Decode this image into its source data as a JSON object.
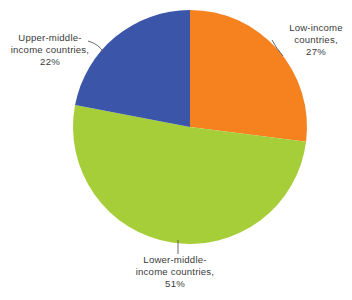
{
  "chart_data": {
    "type": "pie",
    "title": "",
    "categories": [
      "Low-income countries",
      "Lower-middle-income countries",
      "Upper-middle-income countries"
    ],
    "values": [
      27,
      51,
      22
    ],
    "value_unit": "%",
    "colors": [
      "#F5821F",
      "#A6CE39",
      "#3B55A8"
    ],
    "background": "#FFFFFF",
    "text_color": "#3A3A3A",
    "legend": "none",
    "labels_position": "outside-with-leader-lines",
    "start_angle_deg": 0,
    "direction": "clockwise",
    "grid": false,
    "slices": [
      {
        "name": "Low-income countries",
        "value": 27,
        "color": "#F5821F",
        "label_line1": "Low-income",
        "label_line2": "countries,",
        "label_line3": "27%",
        "label_text": "Low-income countries, 27%"
      },
      {
        "name": "Lower-middle-income countries",
        "value": 51,
        "color": "#A6CE39",
        "label_line1": "Lower-middle-",
        "label_line2": "income countries,",
        "label_line3": "51%",
        "label_text": "Lower-middle-income countries, 51%"
      },
      {
        "name": "Upper-middle-income countries",
        "value": 22,
        "color": "#3B55A8",
        "label_line1": "Upper-middle-",
        "label_line2": "income countries,",
        "label_line3": "22%",
        "label_text": "Upper-middle-income countries, 22%"
      }
    ]
  },
  "labels": {
    "low_income": "Low-income\ncountries,\n27%",
    "lower_middle": "Lower-middle-\nincome countries,\n51%",
    "upper_middle": "Upper-middle-\nincome countries,\n22%"
  }
}
